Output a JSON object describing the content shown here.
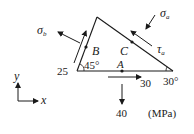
{
  "diagram": {
    "type": "stress-element-wedge",
    "units": "(MPa)",
    "points": {
      "A": "A",
      "B": "B",
      "C": "C"
    },
    "angles": {
      "left": "45°",
      "right": "30°"
    },
    "stresses": {
      "sigma_b": "σ",
      "sigma_b_sub": "b",
      "sigma_a": "σ",
      "sigma_a_sub": "a",
      "tau_a": "τ",
      "tau_a_sub": "a",
      "left_shear": "25",
      "bottom_shear": "30",
      "bottom_normal": "40"
    },
    "axes": {
      "x": "x",
      "y": "y"
    },
    "colors": {
      "line": "#1a1a1a",
      "background": "#ffffff"
    }
  }
}
